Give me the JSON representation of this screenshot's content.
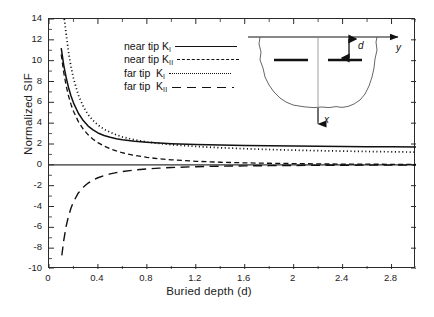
{
  "chart_data": {
    "type": "line",
    "title": "",
    "xlabel": "Buried depth (d)",
    "ylabel": "Normalized SIF",
    "xlim": [
      0,
      3.0
    ],
    "ylim": [
      -10,
      14
    ],
    "xticks": [
      0,
      0.4,
      0.8,
      1.2,
      1.6,
      2,
      2.4,
      2.8
    ],
    "xtick_labels": [
      "0",
      "0.4",
      "0.8",
      "1.2",
      "1.6",
      "2",
      "2.4",
      "2.8"
    ],
    "xminor_step": 0.2,
    "yticks": [
      -10,
      -8,
      -6,
      -4,
      -2,
      0,
      2,
      4,
      6,
      8,
      10,
      12,
      14
    ],
    "ytick_labels": [
      "-10",
      "-8",
      "-6",
      "-4",
      "-2",
      "0",
      "2",
      "4",
      "6",
      "8",
      "10",
      "12",
      "14"
    ],
    "grid": false,
    "legend_position": "upper-center-left",
    "zero_line": true,
    "series": [
      {
        "name": "near tip K_I",
        "label_prefix": "near tip K",
        "label_sub": "I",
        "style": "solid",
        "asymptote": 1.72,
        "points": [
          [
            0.1,
            11.2
          ],
          [
            0.12,
            9.6
          ],
          [
            0.14,
            8.4
          ],
          [
            0.16,
            7.4
          ],
          [
            0.18,
            6.6
          ],
          [
            0.2,
            5.95
          ],
          [
            0.24,
            4.95
          ],
          [
            0.28,
            4.25
          ],
          [
            0.32,
            3.72
          ],
          [
            0.36,
            3.35
          ],
          [
            0.4,
            3.06
          ],
          [
            0.45,
            2.82
          ],
          [
            0.5,
            2.64
          ],
          [
            0.55,
            2.51
          ],
          [
            0.6,
            2.41
          ],
          [
            0.7,
            2.26
          ],
          [
            0.8,
            2.16
          ],
          [
            0.9,
            2.09
          ],
          [
            1.0,
            2.03
          ],
          [
            1.2,
            1.95
          ],
          [
            1.4,
            1.9
          ],
          [
            1.6,
            1.86
          ],
          [
            1.8,
            1.83
          ],
          [
            2.0,
            1.8
          ],
          [
            2.2,
            1.78
          ],
          [
            2.4,
            1.76
          ],
          [
            2.6,
            1.74
          ],
          [
            2.8,
            1.73
          ],
          [
            3.0,
            1.72
          ]
        ]
      },
      {
        "name": "near tip K_II",
        "label_prefix": "near tip K",
        "label_sub": "II",
        "style": "dashed",
        "asymptote": 0.0,
        "points": [
          [
            0.1,
            10.6
          ],
          [
            0.12,
            8.9
          ],
          [
            0.14,
            7.6
          ],
          [
            0.16,
            6.6
          ],
          [
            0.18,
            5.8
          ],
          [
            0.2,
            5.15
          ],
          [
            0.24,
            4.15
          ],
          [
            0.28,
            3.42
          ],
          [
            0.32,
            2.88
          ],
          [
            0.36,
            2.46
          ],
          [
            0.4,
            2.13
          ],
          [
            0.45,
            1.8
          ],
          [
            0.5,
            1.54
          ],
          [
            0.55,
            1.33
          ],
          [
            0.6,
            1.16
          ],
          [
            0.7,
            0.9
          ],
          [
            0.8,
            0.72
          ],
          [
            0.9,
            0.58
          ],
          [
            1.0,
            0.48
          ],
          [
            1.2,
            0.34
          ],
          [
            1.4,
            0.25
          ],
          [
            1.6,
            0.19
          ],
          [
            1.8,
            0.15
          ],
          [
            2.0,
            0.12
          ],
          [
            2.2,
            0.09
          ],
          [
            2.4,
            0.07
          ],
          [
            2.6,
            0.06
          ],
          [
            2.8,
            0.05
          ],
          [
            3.0,
            0.04
          ]
        ]
      },
      {
        "name": "far tip K_I",
        "label_prefix": "far tip  K",
        "label_sub": "I",
        "style": "dotted",
        "asymptote": 1.22,
        "points": [
          [
            0.125,
            14.0
          ],
          [
            0.14,
            12.6
          ],
          [
            0.16,
            10.8
          ],
          [
            0.18,
            9.4
          ],
          [
            0.2,
            8.3
          ],
          [
            0.24,
            6.7
          ],
          [
            0.28,
            5.6
          ],
          [
            0.32,
            4.82
          ],
          [
            0.36,
            4.25
          ],
          [
            0.4,
            3.82
          ],
          [
            0.45,
            3.42
          ],
          [
            0.5,
            3.12
          ],
          [
            0.55,
            2.88
          ],
          [
            0.6,
            2.68
          ],
          [
            0.7,
            2.4
          ],
          [
            0.8,
            2.2
          ],
          [
            0.9,
            2.05
          ],
          [
            1.0,
            1.93
          ],
          [
            1.2,
            1.76
          ],
          [
            1.4,
            1.64
          ],
          [
            1.6,
            1.55
          ],
          [
            1.8,
            1.47
          ],
          [
            2.0,
            1.41
          ],
          [
            2.2,
            1.36
          ],
          [
            2.4,
            1.32
          ],
          [
            2.6,
            1.28
          ],
          [
            2.8,
            1.25
          ],
          [
            3.0,
            1.22
          ]
        ]
      },
      {
        "name": "far tip K_II",
        "label_prefix": "far tip  K",
        "label_sub": "II",
        "style": "longdash",
        "asymptote": 0.0,
        "points": [
          [
            0.105,
            -8.7
          ],
          [
            0.12,
            -7.3
          ],
          [
            0.14,
            -5.9
          ],
          [
            0.16,
            -4.9
          ],
          [
            0.18,
            -4.15
          ],
          [
            0.2,
            -3.55
          ],
          [
            0.24,
            -2.7
          ],
          [
            0.28,
            -2.15
          ],
          [
            0.32,
            -1.75
          ],
          [
            0.36,
            -1.46
          ],
          [
            0.4,
            -1.24
          ],
          [
            0.45,
            -1.03
          ],
          [
            0.5,
            -0.87
          ],
          [
            0.55,
            -0.75
          ],
          [
            0.6,
            -0.65
          ],
          [
            0.7,
            -0.5
          ],
          [
            0.8,
            -0.39
          ],
          [
            0.9,
            -0.32
          ],
          [
            1.0,
            -0.26
          ],
          [
            1.2,
            -0.18
          ],
          [
            1.4,
            -0.13
          ],
          [
            1.6,
            -0.1
          ],
          [
            1.8,
            -0.08
          ],
          [
            2.0,
            -0.06
          ],
          [
            2.2,
            -0.05
          ],
          [
            2.4,
            -0.04
          ],
          [
            2.6,
            -0.03
          ],
          [
            2.8,
            -0.03
          ],
          [
            3.0,
            -0.02
          ]
        ]
      }
    ]
  },
  "legend": {
    "items": [
      {
        "prefix": "near tip K",
        "sub": "I",
        "style": "solid"
      },
      {
        "prefix": "near tip K",
        "sub": "II",
        "style": "dashed"
      },
      {
        "prefix": "far tip  K",
        "sub": "I",
        "style": "dotted"
      },
      {
        "prefix": "far tip  K",
        "sub": "II",
        "style": "longdash"
      }
    ]
  },
  "inset": {
    "description": "trench cross-section with two collinear buried cracks",
    "axis_y_label": "y",
    "axis_x_label": "x",
    "depth_label": "d"
  },
  "colors": {
    "curve": "#111111",
    "axis": "#2a2a2a",
    "text": "#222222",
    "background": "#ffffff"
  }
}
